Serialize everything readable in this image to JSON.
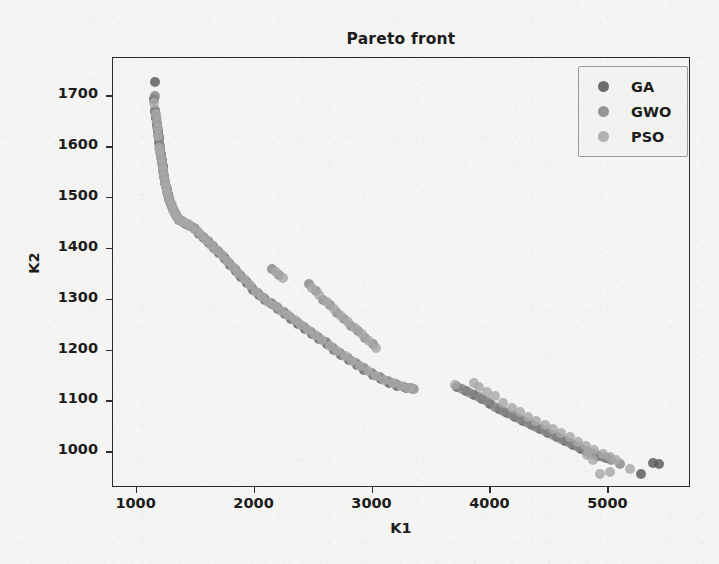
{
  "chart_data": {
    "type": "scatter",
    "title": "Pareto front",
    "xlabel": "K1",
    "ylabel": "K2",
    "xlim": [
      800,
      5700
    ],
    "ylim": [
      930,
      1775
    ],
    "xticks": [
      1000,
      2000,
      3000,
      4000,
      5000
    ],
    "yticks": [
      1000,
      1100,
      1200,
      1300,
      1400,
      1500,
      1600,
      1700
    ],
    "grid": false,
    "legend_position": "upper right",
    "colors": {
      "GA": "#5a5a5a",
      "GWO": "#888888",
      "PSO": "#a8a8a8",
      "axis": "#2b2b2b",
      "background": "#f4f4f2",
      "legend_face": "#f2f2f0",
      "legend_edge": "#9a9a9a"
    },
    "series": [
      {
        "name": "GA",
        "color": "#5a5a5a",
        "points": [
          [
            1155,
            1728
          ],
          [
            1148,
            1694
          ],
          [
            1160,
            1668
          ],
          [
            1168,
            1658
          ],
          [
            1172,
            1646
          ],
          [
            1180,
            1632
          ],
          [
            1186,
            1620
          ],
          [
            1192,
            1608
          ],
          [
            1198,
            1596
          ],
          [
            1205,
            1586
          ],
          [
            1212,
            1574
          ],
          [
            1220,
            1562
          ],
          [
            1228,
            1552
          ],
          [
            1236,
            1542
          ],
          [
            1244,
            1530
          ],
          [
            1254,
            1518
          ],
          [
            1264,
            1508
          ],
          [
            1276,
            1498
          ],
          [
            1290,
            1488
          ],
          [
            1306,
            1478
          ],
          [
            1322,
            1470
          ],
          [
            1340,
            1462
          ],
          [
            1362,
            1456
          ],
          [
            1390,
            1452
          ],
          [
            1420,
            1448
          ],
          [
            1455,
            1444
          ],
          [
            1492,
            1438
          ],
          [
            1530,
            1430
          ],
          [
            1570,
            1422
          ],
          [
            1612,
            1412
          ],
          [
            1656,
            1402
          ],
          [
            1700,
            1392
          ],
          [
            1746,
            1380
          ],
          [
            1792,
            1368
          ],
          [
            1840,
            1356
          ],
          [
            1888,
            1344
          ],
          [
            1938,
            1332
          ],
          [
            1988,
            1320
          ],
          [
            2040,
            1310
          ],
          [
            2092,
            1300
          ],
          [
            2146,
            1292
          ],
          [
            2200,
            1282
          ],
          [
            2256,
            1272
          ],
          [
            2312,
            1262
          ],
          [
            2370,
            1252
          ],
          [
            2428,
            1242
          ],
          [
            2488,
            1232
          ],
          [
            2548,
            1222
          ],
          [
            2610,
            1212
          ],
          [
            2672,
            1202
          ],
          [
            2736,
            1192
          ],
          [
            2800,
            1182
          ],
          [
            2866,
            1172
          ],
          [
            2932,
            1162
          ],
          [
            3000,
            1152
          ],
          [
            3068,
            1144
          ],
          [
            3138,
            1136
          ],
          [
            3208,
            1130
          ],
          [
            3280,
            1126
          ],
          [
            3340,
            1124
          ],
          [
            3720,
            1128
          ],
          [
            3790,
            1120
          ],
          [
            3860,
            1112
          ],
          [
            3930,
            1104
          ],
          [
            4000,
            1096
          ],
          [
            4070,
            1086
          ],
          [
            4140,
            1078
          ],
          [
            4210,
            1070
          ],
          [
            4280,
            1062
          ],
          [
            4350,
            1054
          ],
          [
            4420,
            1046
          ],
          [
            4490,
            1038
          ],
          [
            4560,
            1030
          ],
          [
            4630,
            1022
          ],
          [
            4700,
            1014
          ],
          [
            4770,
            1006
          ],
          [
            4840,
            998
          ],
          [
            4910,
            992
          ],
          [
            4980,
            988
          ],
          [
            5280,
            958
          ],
          [
            5380,
            980
          ],
          [
            5430,
            978
          ]
        ]
      },
      {
        "name": "GWO",
        "color": "#888888",
        "points": [
          [
            1152,
            1700
          ],
          [
            1158,
            1672
          ],
          [
            1166,
            1660
          ],
          [
            1175,
            1640
          ],
          [
            1182,
            1626
          ],
          [
            1190,
            1614
          ],
          [
            1196,
            1602
          ],
          [
            1202,
            1590
          ],
          [
            1210,
            1580
          ],
          [
            1218,
            1568
          ],
          [
            1226,
            1556
          ],
          [
            1234,
            1546
          ],
          [
            1242,
            1534
          ],
          [
            1250,
            1524
          ],
          [
            1260,
            1512
          ],
          [
            1272,
            1502
          ],
          [
            1286,
            1492
          ],
          [
            1300,
            1482
          ],
          [
            1316,
            1474
          ],
          [
            1334,
            1466
          ],
          [
            1356,
            1458
          ],
          [
            1382,
            1454
          ],
          [
            1412,
            1450
          ],
          [
            1448,
            1446
          ],
          [
            1484,
            1440
          ],
          [
            1522,
            1434
          ],
          [
            1562,
            1424
          ],
          [
            1604,
            1416
          ],
          [
            1648,
            1406
          ],
          [
            1692,
            1396
          ],
          [
            1738,
            1384
          ],
          [
            1784,
            1372
          ],
          [
            1832,
            1360
          ],
          [
            1880,
            1348
          ],
          [
            1930,
            1336
          ],
          [
            1980,
            1324
          ],
          [
            2032,
            1314
          ],
          [
            2084,
            1304
          ],
          [
            2138,
            1294
          ],
          [
            2192,
            1286
          ],
          [
            2150,
            1360
          ],
          [
            2210,
            1348
          ],
          [
            2248,
            1276
          ],
          [
            2304,
            1266
          ],
          [
            2362,
            1256
          ],
          [
            2420,
            1246
          ],
          [
            2480,
            1236
          ],
          [
            2540,
            1226
          ],
          [
            2602,
            1216
          ],
          [
            2664,
            1206
          ],
          [
            2460,
            1330
          ],
          [
            2520,
            1318
          ],
          [
            2580,
            1300
          ],
          [
            2640,
            1290
          ],
          [
            2700,
            1274
          ],
          [
            2728,
            1196
          ],
          [
            2792,
            1186
          ],
          [
            2858,
            1176
          ],
          [
            2924,
            1166
          ],
          [
            2992,
            1156
          ],
          [
            2760,
            1262
          ],
          [
            2820,
            1248
          ],
          [
            2880,
            1238
          ],
          [
            2940,
            1224
          ],
          [
            3000,
            1212
          ],
          [
            3060,
            1148
          ],
          [
            3130,
            1140
          ],
          [
            3200,
            1134
          ],
          [
            3270,
            1128
          ],
          [
            3330,
            1126
          ],
          [
            3760,
            1124
          ],
          [
            3830,
            1116
          ],
          [
            3900,
            1108
          ],
          [
            3970,
            1100
          ],
          [
            4040,
            1090
          ],
          [
            4110,
            1082
          ],
          [
            4180,
            1074
          ],
          [
            4250,
            1066
          ],
          [
            4320,
            1058
          ],
          [
            4390,
            1050
          ],
          [
            4460,
            1042
          ],
          [
            4530,
            1034
          ],
          [
            4600,
            1026
          ],
          [
            4670,
            1018
          ],
          [
            4740,
            1010
          ],
          [
            4810,
            1002
          ],
          [
            4880,
            996
          ],
          [
            4950,
            990
          ],
          [
            5020,
            986
          ],
          [
            5100,
            978
          ]
        ]
      },
      {
        "name": "PSO",
        "color": "#a8a8a8",
        "points": [
          [
            1150,
            1686
          ],
          [
            1162,
            1664
          ],
          [
            1170,
            1652
          ],
          [
            1178,
            1638
          ],
          [
            1184,
            1622
          ],
          [
            1194,
            1598
          ],
          [
            1200,
            1592
          ],
          [
            1208,
            1578
          ],
          [
            1216,
            1566
          ],
          [
            1224,
            1554
          ],
          [
            1232,
            1544
          ],
          [
            1240,
            1532
          ],
          [
            1248,
            1522
          ],
          [
            1257,
            1514
          ],
          [
            1268,
            1504
          ],
          [
            1282,
            1494
          ],
          [
            1296,
            1486
          ],
          [
            1312,
            1476
          ],
          [
            1328,
            1468
          ],
          [
            1348,
            1460
          ],
          [
            1372,
            1456
          ],
          [
            1402,
            1452
          ],
          [
            1436,
            1448
          ],
          [
            1472,
            1442
          ],
          [
            1510,
            1436
          ],
          [
            1548,
            1428
          ],
          [
            1590,
            1418
          ],
          [
            1632,
            1408
          ],
          [
            1676,
            1398
          ],
          [
            1722,
            1388
          ],
          [
            1768,
            1376
          ],
          [
            1814,
            1364
          ],
          [
            1862,
            1352
          ],
          [
            1912,
            1340
          ],
          [
            1962,
            1328
          ],
          [
            2012,
            1316
          ],
          [
            2064,
            1306
          ],
          [
            2118,
            1296
          ],
          [
            2172,
            1288
          ],
          [
            2228,
            1278
          ],
          [
            2180,
            1354
          ],
          [
            2240,
            1342
          ],
          [
            2284,
            1270
          ],
          [
            2340,
            1260
          ],
          [
            2398,
            1250
          ],
          [
            2456,
            1240
          ],
          [
            2516,
            1230
          ],
          [
            2576,
            1220
          ],
          [
            2638,
            1210
          ],
          [
            2700,
            1200
          ],
          [
            2490,
            1324
          ],
          [
            2550,
            1310
          ],
          [
            2610,
            1296
          ],
          [
            2670,
            1282
          ],
          [
            2730,
            1268
          ],
          [
            2764,
            1190
          ],
          [
            2828,
            1180
          ],
          [
            2894,
            1170
          ],
          [
            2960,
            1160
          ],
          [
            3028,
            1150
          ],
          [
            2790,
            1256
          ],
          [
            2850,
            1244
          ],
          [
            2910,
            1232
          ],
          [
            2970,
            1218
          ],
          [
            3030,
            1206
          ],
          [
            3100,
            1142
          ],
          [
            3170,
            1136
          ],
          [
            3240,
            1130
          ],
          [
            3300,
            1126
          ],
          [
            3352,
            1124
          ],
          [
            3700,
            1132
          ],
          [
            3860,
            1136
          ],
          [
            3900,
            1128
          ],
          [
            3970,
            1118
          ],
          [
            4040,
            1110
          ],
          [
            4110,
            1098
          ],
          [
            4180,
            1088
          ],
          [
            4250,
            1080
          ],
          [
            4320,
            1070
          ],
          [
            4390,
            1062
          ],
          [
            4460,
            1054
          ],
          [
            4530,
            1046
          ],
          [
            4600,
            1038
          ],
          [
            4670,
            1030
          ],
          [
            4740,
            1020
          ],
          [
            4810,
            1012
          ],
          [
            4880,
            1004
          ],
          [
            4950,
            996
          ],
          [
            5010,
            990
          ],
          [
            5060,
            986
          ],
          [
            4820,
            994
          ],
          [
            4870,
            986
          ],
          [
            4930,
            958
          ],
          [
            5010,
            962
          ],
          [
            5180,
            968
          ]
        ]
      }
    ]
  },
  "legend": {
    "entries": [
      {
        "label": "GA",
        "color": "#5a5a5a"
      },
      {
        "label": "GWO",
        "color": "#888888"
      },
      {
        "label": "PSO",
        "color": "#a8a8a8"
      }
    ]
  }
}
